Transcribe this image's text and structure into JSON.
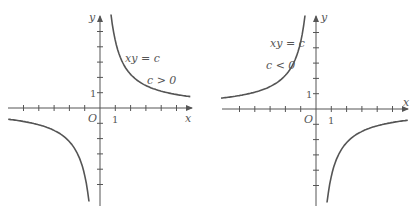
{
  "panels": [
    {
      "id": "left",
      "equation_label": "xy = c",
      "condition_label": "c > 0",
      "origin_label": "O",
      "x_axis_label": "x",
      "y_axis_label": "y",
      "x_unit_label": "1",
      "y_unit_label": "1"
    },
    {
      "id": "right",
      "equation_label": "xy = c",
      "condition_label": "c < 0",
      "origin_label": "O",
      "x_axis_label": "x",
      "y_axis_label": "y",
      "x_unit_label": "1",
      "y_unit_label": "1"
    }
  ],
  "chart_data": [
    {
      "type": "line",
      "title": "xy = c, c > 0",
      "xlabel": "x",
      "ylabel": "y",
      "xlim": [
        -6,
        6
      ],
      "ylim": [
        -6,
        6
      ],
      "series": [
        {
          "name": "xy=c (c>0)",
          "c": 4.4
        }
      ]
    },
    {
      "type": "line",
      "title": "xy = c, c < 0",
      "xlabel": "x",
      "ylabel": "y",
      "xlim": [
        -6,
        6
      ],
      "ylim": [
        -6,
        6
      ],
      "series": [
        {
          "name": "xy=c (c<0)",
          "c": -4.4
        }
      ]
    }
  ]
}
